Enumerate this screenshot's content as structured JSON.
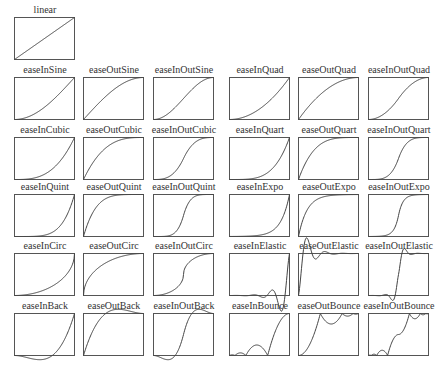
{
  "style": {
    "line_color": "#444444",
    "box_color": "#555555",
    "background": "#ffffff"
  },
  "charts": [
    {
      "name": "linear",
      "fn": "linear",
      "col": 0,
      "row": 0
    },
    {
      "name": "easeInSine",
      "fn": "easeInSine",
      "col": 0,
      "row": 1
    },
    {
      "name": "easeOutSine",
      "fn": "easeOutSine",
      "col": 1,
      "row": 1
    },
    {
      "name": "easeInOutSine",
      "fn": "easeInOutSine",
      "col": 2,
      "row": 1
    },
    {
      "name": "easeInQuad",
      "fn": "easeInQuad",
      "col": 3,
      "row": 1
    },
    {
      "name": "easeOutQuad",
      "fn": "easeOutQuad",
      "col": 4,
      "row": 1
    },
    {
      "name": "easeInOutQuad",
      "fn": "easeInOutQuad",
      "col": 5,
      "row": 1
    },
    {
      "name": "easeInCubic",
      "fn": "easeInCubic",
      "col": 0,
      "row": 2
    },
    {
      "name": "easeOutCubic",
      "fn": "easeOutCubic",
      "col": 1,
      "row": 2
    },
    {
      "name": "easeInOutCubic",
      "fn": "easeInOutCubic",
      "col": 2,
      "row": 2
    },
    {
      "name": "easeInQuart",
      "fn": "easeInQuart",
      "col": 3,
      "row": 2
    },
    {
      "name": "easeOutQuart",
      "fn": "easeOutQuart",
      "col": 4,
      "row": 2
    },
    {
      "name": "easeInOutQuart",
      "fn": "easeInOutQuart",
      "col": 5,
      "row": 2
    },
    {
      "name": "easeInQuint",
      "fn": "easeInQuint",
      "col": 0,
      "row": 3
    },
    {
      "name": "easeOutQuint",
      "fn": "easeOutQuint",
      "col": 1,
      "row": 3
    },
    {
      "name": "easeInOutQuint",
      "fn": "easeInOutQuint",
      "col": 2,
      "row": 3
    },
    {
      "name": "easeInExpo",
      "fn": "easeInExpo",
      "col": 3,
      "row": 3
    },
    {
      "name": "easeOutExpo",
      "fn": "easeOutExpo",
      "col": 4,
      "row": 3
    },
    {
      "name": "easeInOutExpo",
      "fn": "easeInOutExpo",
      "col": 5,
      "row": 3
    },
    {
      "name": "easeInCirc",
      "fn": "easeInCirc",
      "col": 0,
      "row": 4
    },
    {
      "name": "easeOutCirc",
      "fn": "easeOutCirc",
      "col": 1,
      "row": 4
    },
    {
      "name": "easeInOutCirc",
      "fn": "easeInOutCirc",
      "col": 2,
      "row": 4
    },
    {
      "name": "easeInElastic",
      "fn": "easeInElastic",
      "col": 3,
      "row": 4
    },
    {
      "name": "easeOutElastic",
      "fn": "easeOutElastic",
      "col": 4,
      "row": 4
    },
    {
      "name": "easeInOutElastic",
      "fn": "easeInOutElastic",
      "col": 5,
      "row": 4
    },
    {
      "name": "easeInBack",
      "fn": "easeInBack",
      "col": 0,
      "row": 5
    },
    {
      "name": "easeOutBack",
      "fn": "easeOutBack",
      "col": 1,
      "row": 5
    },
    {
      "name": "easeInOutBack",
      "fn": "easeInOutBack",
      "col": 2,
      "row": 5
    },
    {
      "name": "easeInBounce",
      "fn": "easeInBounce",
      "col": 3,
      "row": 5
    },
    {
      "name": "easeOutBounce",
      "fn": "easeOutBounce",
      "col": 4,
      "row": 5
    },
    {
      "name": "easeInOutBounce",
      "fn": "easeInOutBounce",
      "col": 5,
      "row": 5
    }
  ],
  "layout": {
    "col_x": [
      14,
      83,
      153,
      229,
      298,
      368
    ],
    "row_box_top": [
      17,
      77,
      137,
      194,
      253,
      313
    ],
    "box_w": 60,
    "box_h": 42
  }
}
